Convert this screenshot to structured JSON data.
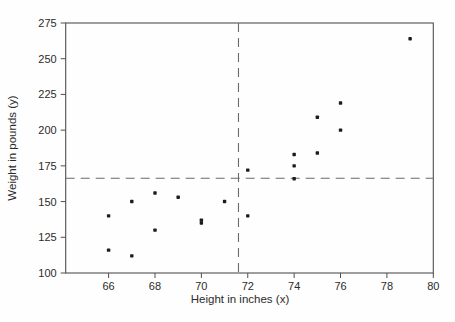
{
  "figure": {
    "caption": "Figure 4.1: Bivariate scatter plot of the data in Table 4.1"
  },
  "chart_data": {
    "type": "scatter",
    "title": "",
    "xlabel": "Height in inches (x)",
    "ylabel": "Weight in pounds (y)",
    "xlim": [
      64.15,
      80
    ],
    "ylim": [
      100,
      275
    ],
    "x_ticks": [
      66,
      68,
      70,
      72,
      74,
      76,
      78,
      80
    ],
    "y_ticks": [
      100,
      125,
      150,
      175,
      200,
      225,
      250,
      275
    ],
    "points": [
      [
        66,
        116
      ],
      [
        66,
        140
      ],
      [
        67,
        112
      ],
      [
        67,
        150
      ],
      [
        68,
        130
      ],
      [
        68,
        156
      ],
      [
        69,
        153
      ],
      [
        70,
        135
      ],
      [
        70,
        137
      ],
      [
        71,
        150
      ],
      [
        72,
        140
      ],
      [
        72,
        172
      ],
      [
        74,
        166
      ],
      [
        74,
        175
      ],
      [
        74,
        183
      ],
      [
        75,
        184
      ],
      [
        75,
        209
      ],
      [
        76,
        200
      ],
      [
        76,
        219
      ],
      [
        79,
        264
      ]
    ],
    "reference_lines": {
      "vertical_x": 71.6,
      "horizontal_y": 166.3
    },
    "grid": false,
    "legend": false,
    "colors": {
      "point": "#1c1c1c",
      "axis": "#4f4f4f",
      "dashed": "#6a6a6a",
      "text": "#2b2b2b"
    }
  }
}
